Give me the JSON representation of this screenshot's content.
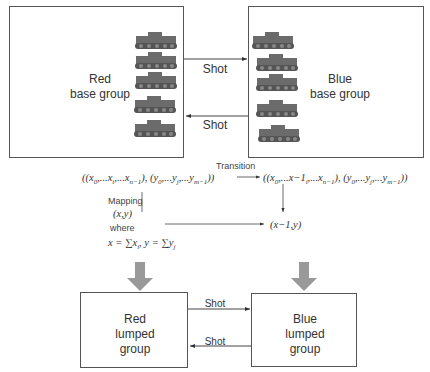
{
  "top": {
    "red_box": {
      "line1": "Red",
      "line2": "base group"
    },
    "blue_box": {
      "line1": "Blue",
      "line2": "base group"
    },
    "shot_upper": "Shot",
    "shot_lower": "Shot",
    "red_tanks": [
      {
        "x": 134,
        "y": 30
      },
      {
        "x": 134,
        "y": 50
      },
      {
        "x": 134,
        "y": 70
      },
      {
        "x": 133,
        "y": 94
      },
      {
        "x": 133,
        "y": 118
      }
    ],
    "blue_tanks": [
      {
        "x": 251,
        "y": 30
      },
      {
        "x": 255,
        "y": 52
      },
      {
        "x": 255,
        "y": 72
      },
      {
        "x": 255,
        "y": 98
      },
      {
        "x": 257,
        "y": 123
      }
    ]
  },
  "formulas": {
    "transition_label": "Transition",
    "mapping_label": "Mapping",
    "where_label": "where",
    "left_state": "((x₀,...xᵢ,...xₙ₋₁), (y₀,...yⱼ,...yₘ₋₁))",
    "right_state": "((x₀,...x−1ᵢ,...xₙ₋₁), (y₀,...yⱼ,...yₘ₋₁))",
    "lumped_state": "(x,y)",
    "lumped_next": "(x−1,y)",
    "definition": "x = ∑xᵢ, y = ∑yⱼ"
  },
  "bottom": {
    "red_box": {
      "line1": "Red",
      "line2": "lumped",
      "line3": "group"
    },
    "blue_box": {
      "line1": "Blue",
      "line2": "lumped",
      "line3": "group"
    },
    "shot_upper": "Shot",
    "shot_lower": "Shot"
  },
  "colors": {
    "line": "#444444",
    "thick_arrow": "#999999",
    "tank": "#6b6b6b"
  }
}
